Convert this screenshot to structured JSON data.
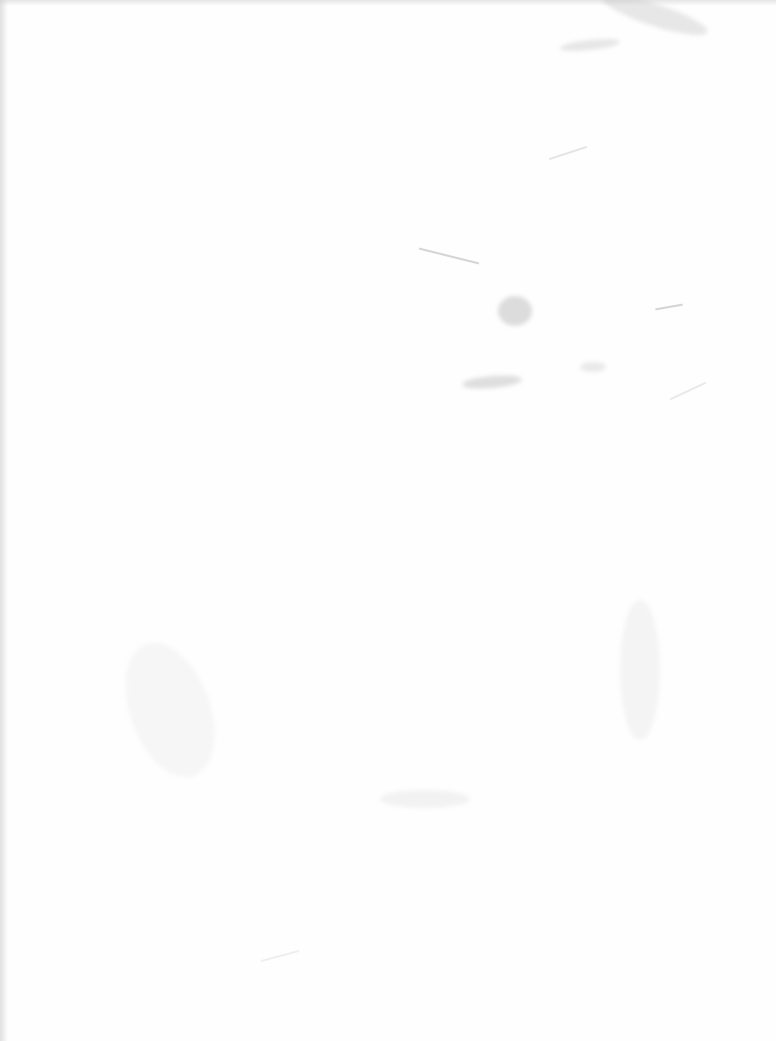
{
  "page": {
    "type": "blank-scanned-page",
    "text_content": [],
    "background_color": "#fefefe",
    "mark_color": "#b0b0b0"
  }
}
